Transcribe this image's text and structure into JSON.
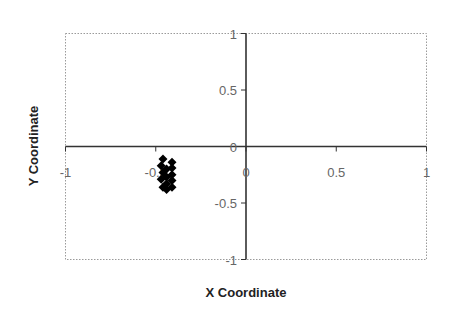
{
  "chart_data": {
    "type": "scatter",
    "title": "",
    "xlabel": "X Coordinate",
    "ylabel": "Y Coordinate",
    "xlim": [
      -1,
      1
    ],
    "ylim": [
      -1,
      1
    ],
    "x_ticks": [
      -1,
      -0.5,
      0,
      0.5,
      1
    ],
    "y_ticks": [
      -1,
      -0.5,
      0,
      0.5,
      1
    ],
    "x_tick_labels": [
      "-1",
      "-0.5",
      "0",
      "0.5",
      "1"
    ],
    "y_tick_labels": [
      "-1",
      "-0.5",
      "0",
      "0.5",
      "1"
    ],
    "grid": false,
    "legend": null,
    "marker": "diamond",
    "marker_color": "#000000",
    "series": [
      {
        "name": "points",
        "x": [
          -0.46,
          -0.47,
          -0.46,
          -0.47,
          -0.46,
          -0.44,
          -0.44,
          -0.44,
          -0.44,
          -0.41,
          -0.41,
          -0.41,
          -0.41,
          -0.41
        ],
        "y": [
          -0.11,
          -0.17,
          -0.23,
          -0.29,
          -0.36,
          -0.2,
          -0.27,
          -0.33,
          -0.38,
          -0.14,
          -0.19,
          -0.25,
          -0.3,
          -0.36
        ]
      }
    ]
  }
}
